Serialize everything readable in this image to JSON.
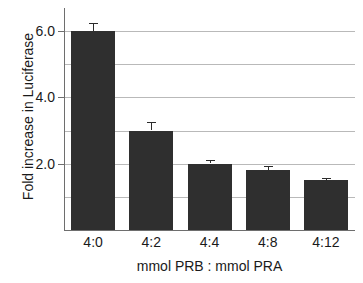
{
  "chart_data": {
    "type": "bar",
    "title": "",
    "xlabel": "mmol PRB : mmol PRA",
    "ylabel": "Fold increase in Luciferase",
    "categories": [
      "4:0",
      "4:2",
      "4:4",
      "4:8",
      "4:12"
    ],
    "values": [
      6.0,
      3.0,
      2.0,
      1.8,
      1.5
    ],
    "errors": [
      0.25,
      0.25,
      0.1,
      0.12,
      0.08
    ],
    "ylim": [
      0,
      6.7
    ],
    "ytick_values": [
      1.0,
      2.0,
      3.0,
      4.0,
      5.0,
      6.0
    ],
    "ytick_labels": [
      "",
      "2.0",
      "",
      "4.0",
      "",
      "6.0"
    ],
    "grid": "horizontal",
    "legend": "none",
    "bar_color": "#2f2f2f",
    "grid_color": "#b9b9b9",
    "axis_color": "#6e6e6e"
  }
}
